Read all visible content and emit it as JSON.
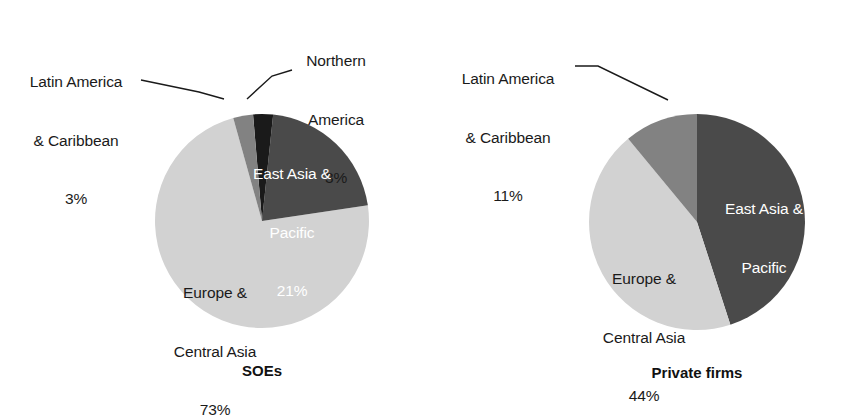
{
  "figure": {
    "background_color": "#ffffff",
    "width": 846,
    "height": 408
  },
  "palette": {
    "dark_gray": "#4a4a4a",
    "medium_gray": "#828282",
    "light_gray": "#d2d2d2",
    "black": "#1a1a1a",
    "label_dark": "#1a1a1a",
    "label_light": "#ffffff",
    "leader_line": "#1a1a1a"
  },
  "chart_data": [
    {
      "type": "pie",
      "title": "SOEs",
      "categories": [
        "East Asia & Pacific",
        "Europe & Central Asia",
        "Latin America & Caribbean",
        "Northern America"
      ],
      "values": [
        21,
        73,
        3,
        3
      ],
      "value_unit": "%",
      "colors": [
        "#4a4a4a",
        "#d2d2d2",
        "#828282",
        "#1a1a1a"
      ],
      "start_angle_deg": 6,
      "legend": "none",
      "labels": "inside-and-callout"
    },
    {
      "type": "pie",
      "title": "Private firms",
      "categories": [
        "East Asia & Pacific",
        "Europe & Central Asia",
        "Latin America & Caribbean"
      ],
      "values": [
        45,
        44,
        11
      ],
      "value_unit": "%",
      "colors": [
        "#4a4a4a",
        "#d2d2d2",
        "#828282"
      ],
      "start_angle_deg": 0,
      "legend": "none",
      "labels": "inside-and-callout"
    }
  ],
  "charts": {
    "soes": {
      "caption": "SOEs",
      "slices": {
        "east_asia": {
          "name_line1": "East Asia &",
          "name_line2": "Pacific",
          "percent": "21%"
        },
        "europe": {
          "name_line1": "Europe &",
          "name_line2": "Central Asia",
          "percent": "73%"
        },
        "latin_america": {
          "name_line1": "Latin America",
          "name_line2": "& Caribbean",
          "percent": "3%"
        },
        "northern_america": {
          "name_line1": "Northern",
          "name_line2": "America",
          "percent": "3%"
        }
      }
    },
    "private": {
      "caption": "Private firms",
      "slices": {
        "east_asia": {
          "name_line1": "East Asia &",
          "name_line2": "Pacific",
          "percent": "45%"
        },
        "europe": {
          "name_line1": "Europe &",
          "name_line2": "Central Asia",
          "percent": "44%"
        },
        "latin_america": {
          "name_line1": "Latin America",
          "name_line2": "& Caribbean",
          "percent": "11%"
        }
      }
    }
  }
}
